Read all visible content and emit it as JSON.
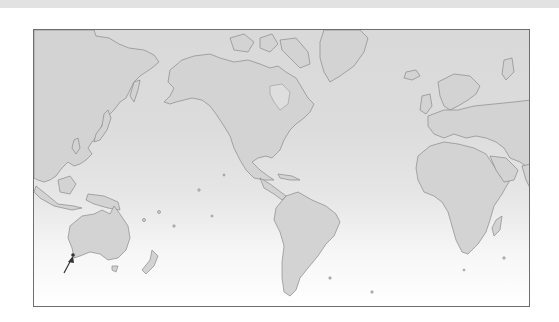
{
  "figure": {
    "type": "world-map",
    "projection": "mercator-pacific-centered",
    "annotation": {
      "kind": "arrow",
      "points_to": "southwest-australia",
      "color": "#333333"
    },
    "colors": {
      "land": "#d3d3d3",
      "ocean_top": "#d9d9d9",
      "ocean_bottom": "#ffffff",
      "border": "#6e6e6e",
      "coast": "#8a8a8a"
    },
    "regions": [
      "Asia",
      "Australia",
      "New Zealand",
      "North America",
      "Greenland",
      "South America",
      "Europe",
      "Africa",
      "Madagascar",
      "Arabia",
      "India"
    ]
  }
}
